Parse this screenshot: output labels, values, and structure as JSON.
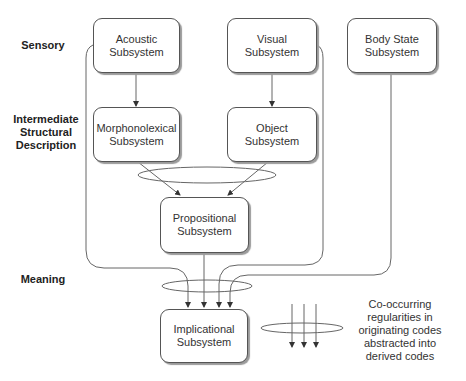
{
  "levels": {
    "sensory": "Sensory",
    "intermediate": "Intermediate Structural Description",
    "meaning": "Meaning"
  },
  "subsystems": {
    "acoustic": "Acoustic Subsystem",
    "visual": "Visual Subsystem",
    "body_state": "Body State Subsystem",
    "morphonolexical": "Morphonolexical Subsystem",
    "object": "Object Subsystem",
    "propositional": "Propositional Subsystem",
    "implicational": "Implicational Subsystem"
  },
  "legend": {
    "text": "Co-occurring regularities in originating codes abstracted into derived codes"
  },
  "colors": {
    "line": "#555555",
    "box_border": "#555555",
    "shadow": "#9a9a9a"
  }
}
